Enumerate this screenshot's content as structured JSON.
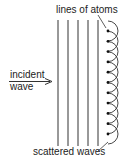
{
  "labels": {
    "top": "lines of atoms",
    "incident_line1": "incident",
    "incident_line2": "wave",
    "bottom": "scattered waves"
  },
  "geometry": {
    "line_xs": [
      58,
      68,
      78,
      88,
      98
    ],
    "line_top": 20,
    "line_bottom": 146,
    "atom_x": 108,
    "atom_ys": [
      31,
      41.3,
      51.6,
      61.9,
      72.2,
      82.5,
      92.8,
      103.1,
      113.4,
      123.7,
      134
    ],
    "arc_radius": 10
  },
  "colors": {
    "stroke": "#333333",
    "text": "#222222"
  }
}
